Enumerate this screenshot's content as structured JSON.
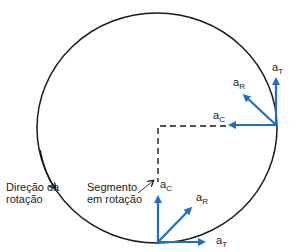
{
  "colors": {
    "vector": "#1a6fc9",
    "circle": "#1a1a1a",
    "dashed": "#1a1a1a",
    "text": "#222222"
  },
  "labels": {
    "rotation_direction": [
      "Direção da",
      "rotação"
    ],
    "rotating_segment": [
      "Segmento",
      "em rotação"
    ]
  },
  "vectors": {
    "right": {
      "a_T": {
        "base": "a",
        "sub": "T"
      },
      "a_R": {
        "base": "a",
        "sub": "R"
      },
      "a_C": {
        "base": "a",
        "sub": "C"
      }
    },
    "bottom": {
      "a_C": {
        "base": "a",
        "sub": "C"
      },
      "a_R": {
        "base": "a",
        "sub": "R"
      },
      "a_T": {
        "base": "a",
        "sub": "T"
      }
    }
  }
}
